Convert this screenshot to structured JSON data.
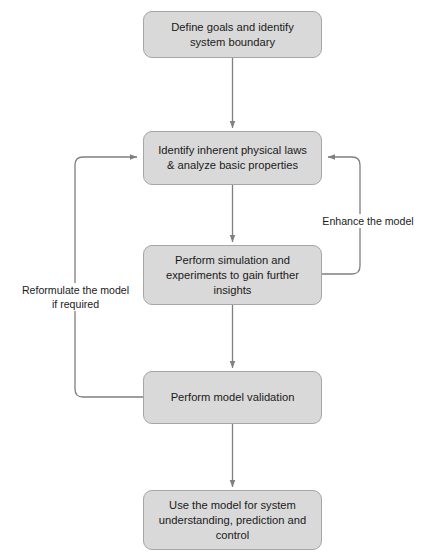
{
  "diagram": {
    "colors": {
      "node_fill": "#d9d9d9",
      "node_border": "#a6a6a6",
      "edge_line": "#7f7f7f",
      "text": "#1a1a1a",
      "background": "#ffffff"
    },
    "nodes": [
      {
        "id": "define-goals",
        "label": "Define goals and identify system boundary",
        "x": 143,
        "y": 11,
        "w": 179,
        "h": 47
      },
      {
        "id": "identify-laws",
        "label": "Identify inherent physical laws & analyze basic properties",
        "x": 143,
        "y": 131,
        "w": 179,
        "h": 54
      },
      {
        "id": "perform-simulation",
        "label": "Perform simulation and experiments to gain further insights",
        "x": 143,
        "y": 245,
        "w": 179,
        "h": 60
      },
      {
        "id": "model-validation",
        "label": "Perform model validation",
        "x": 143,
        "y": 371,
        "w": 179,
        "h": 53
      },
      {
        "id": "use-model",
        "label": "Use the model for system understanding, prediction and control",
        "x": 143,
        "y": 490,
        "w": 179,
        "h": 60
      }
    ],
    "edge_labels": [
      {
        "id": "enhance",
        "text": "Enhance the model",
        "x": 313,
        "y": 214
      },
      {
        "id": "reformulate",
        "text": "Reformulate the model if required",
        "x": 18,
        "y": 283
      }
    ]
  }
}
